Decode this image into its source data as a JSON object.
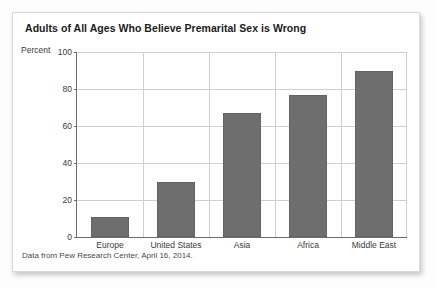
{
  "chart_data": {
    "type": "bar",
    "title": "Adults of All Ages Who Believe Premarital Sex is Wrong",
    "xlabel": "",
    "ylabel": "Percent",
    "categories": [
      "Europe",
      "United States",
      "Asia",
      "Africa",
      "Middle East"
    ],
    "values": [
      11,
      30,
      67,
      77,
      90
    ],
    "ylim": [
      0,
      100
    ],
    "yticks": [
      0,
      20,
      40,
      60,
      80,
      100
    ],
    "ytick_labels": [
      "0",
      "20",
      "40",
      "60",
      "80",
      "100"
    ],
    "grid": "horizontal-and-vertical",
    "legend": "none",
    "source_note": "Data from Pew Research Center, April 16, 2014.",
    "bar_color": "#6e6e6e",
    "gridline_color": "#cfcfcf",
    "axis_color": "#6d6d6d",
    "card_background": "#ffffff",
    "text_color": "#1b1b1b"
  }
}
